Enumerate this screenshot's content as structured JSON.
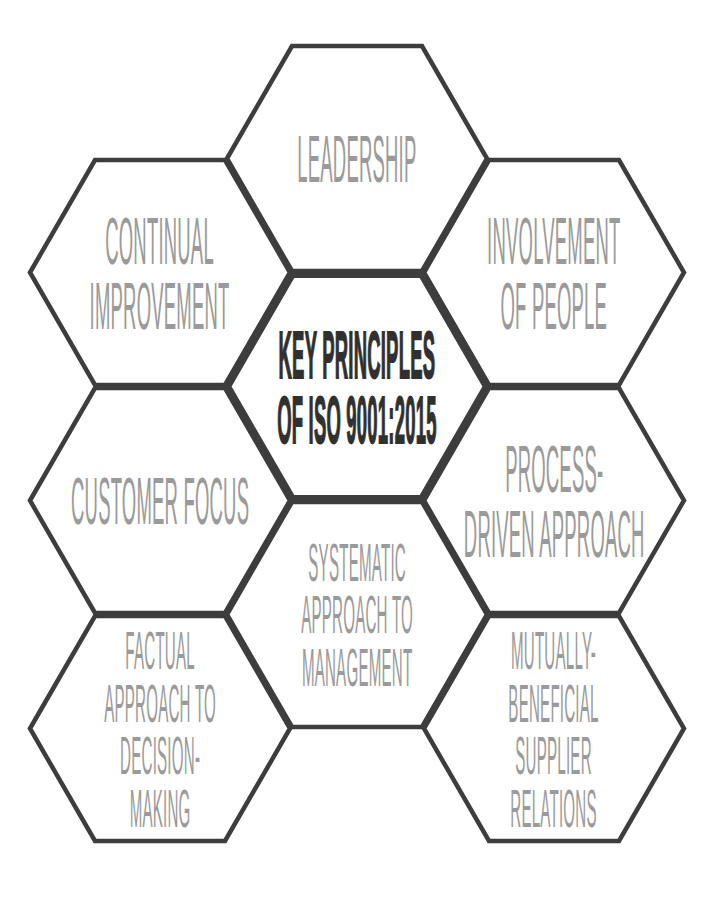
{
  "diagram": {
    "title": "KEY PRINCIPLES OF ISO 9001:2015",
    "colors": {
      "background_color": "#ffffff",
      "outline_color": "#3d3d3d",
      "label_color": "#9a9a9a",
      "center_text_color": "#303030"
    },
    "hexagons": [
      {
        "id": "leadership",
        "label": "LEADERSHIP"
      },
      {
        "id": "continual-improvement",
        "label": "CONTINUAL\nIMPROVEMENT"
      },
      {
        "id": "involvement-of-people",
        "label": "INVOLVEMENT\nOF PEOPLE"
      },
      {
        "id": "key-principles-center",
        "label": "KEY PRINCIPLES\nOF ISO 9001:2015"
      },
      {
        "id": "customer-focus",
        "label": "CUSTOMER FOCUS"
      },
      {
        "id": "process-driven-approach",
        "label": "PROCESS-\nDRIVEN APPROACH"
      },
      {
        "id": "systematic-approach-to-management",
        "label": "SYSTEMATIC\nAPPROACH TO\nMANAGEMENT"
      },
      {
        "id": "factual-approach-to-decision-making",
        "label": "FACTUAL\nAPPROACH TO\nDECISION-\nMAKING"
      },
      {
        "id": "mutually-beneficial-supplier-relations",
        "label": "MUTUALLY-\nBENEFICIAL\nSUPPLIER\nRELATIONS"
      }
    ]
  }
}
